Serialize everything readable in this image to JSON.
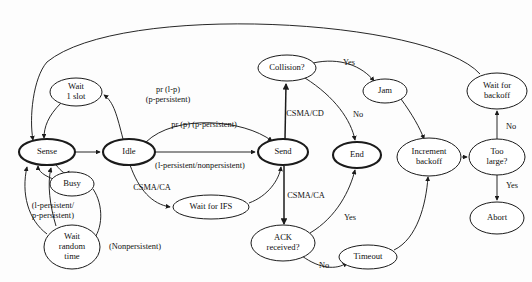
{
  "diagram": {
    "background_color": "#fdfdfd",
    "stroke_color": "#1b1b1b",
    "nodes": [
      {
        "id": "sense",
        "label_lines": [
          "Sense"
        ],
        "cx": 47,
        "cy": 152,
        "rx": 28,
        "ry": 13,
        "bold": true
      },
      {
        "id": "wait1slot",
        "label_lines": [
          "Wait",
          "1 slot"
        ],
        "cx": 76,
        "cy": 92,
        "rx": 26,
        "ry": 14,
        "bold": false
      },
      {
        "id": "idle",
        "label_lines": [
          "Idle"
        ],
        "cx": 129,
        "cy": 152,
        "rx": 26,
        "ry": 13,
        "bold": true
      },
      {
        "id": "busy",
        "label_lines": [
          "Busy"
        ],
        "cx": 72,
        "cy": 184,
        "rx": 22,
        "ry": 12,
        "bold": false
      },
      {
        "id": "waitrandom",
        "label_lines": [
          "Wait",
          "random",
          "time"
        ],
        "cx": 72,
        "cy": 247,
        "rx": 28,
        "ry": 22,
        "bold": false
      },
      {
        "id": "waitifs",
        "label_lines": [
          "Wait for IFS"
        ],
        "cx": 211,
        "cy": 207,
        "rx": 38,
        "ry": 12,
        "bold": false
      },
      {
        "id": "send",
        "label_lines": [
          "Send"
        ],
        "cx": 283,
        "cy": 152,
        "rx": 25,
        "ry": 13,
        "bold": true
      },
      {
        "id": "collision",
        "label_lines": [
          "Collision?"
        ],
        "cx": 287,
        "cy": 68,
        "rx": 29,
        "ry": 13,
        "bold": false
      },
      {
        "id": "jam",
        "label_lines": [
          "Jam"
        ],
        "cx": 385,
        "cy": 91,
        "rx": 22,
        "ry": 12,
        "bold": false
      },
      {
        "id": "end",
        "label_lines": [
          "End"
        ],
        "cx": 357,
        "cy": 155,
        "rx": 24,
        "ry": 13,
        "bold": true
      },
      {
        "id": "ack",
        "label_lines": [
          "ACK",
          "received?"
        ],
        "cx": 283,
        "cy": 243,
        "rx": 32,
        "ry": 18,
        "bold": false
      },
      {
        "id": "timeout",
        "label_lines": [
          "Timeout"
        ],
        "cx": 368,
        "cy": 257,
        "rx": 29,
        "ry": 12,
        "bold": false
      },
      {
        "id": "increment",
        "label_lines": [
          "Increment",
          "backoff"
        ],
        "cx": 429,
        "cy": 157,
        "rx": 32,
        "ry": 19,
        "bold": false
      },
      {
        "id": "toolarge",
        "label_lines": [
          "Too",
          "large?"
        ],
        "cx": 497,
        "cy": 157,
        "rx": 28,
        "ry": 18,
        "bold": false
      },
      {
        "id": "waitbackoff",
        "label_lines": [
          "Wait for",
          "backoff"
        ],
        "cx": 497,
        "cy": 91,
        "rx": 30,
        "ry": 18,
        "bold": false
      },
      {
        "id": "abort",
        "label_lines": [
          "Abort"
        ],
        "cx": 497,
        "cy": 218,
        "rx": 27,
        "ry": 16,
        "bold": false
      }
    ],
    "edges": [
      {
        "id": "waitbackoff-to-sense",
        "from": "waitbackoff",
        "to": "sense",
        "path": "M 480 74 C 430 18 120 2 47 62 C 33 78 29 118 33 140",
        "thick": false
      },
      {
        "id": "wait1slot-to-sense",
        "from": "wait1slot",
        "to": "sense",
        "path": "M 61 103 C 48 116 44 127 44 138",
        "thick": false
      },
      {
        "id": "idle-to-wait1slot",
        "from": "idle",
        "to": "wait1slot",
        "path": "M 123 139 C 117 116 114 102 104 95",
        "thick": false
      },
      {
        "id": "sense-to-idle",
        "from": "sense",
        "to": "idle",
        "path": "M 75 152 L 100 152",
        "thick": false
      },
      {
        "id": "idle-to-send-top",
        "from": "idle",
        "to": "send",
        "path": "M 146 142 C 175 114 243 119 272 141",
        "thick": false
      },
      {
        "id": "idle-to-send-mid",
        "from": "idle",
        "to": "send",
        "path": "M 155 152 L 255 152",
        "thick": false
      },
      {
        "id": "idle-to-waitifs",
        "from": "idle",
        "to": "waitifs",
        "path": "M 130 165 C 139 190 152 204 170 207",
        "thick": false
      },
      {
        "id": "waitifs-to-send",
        "from": "waitifs",
        "to": "send",
        "path": "M 249 203 C 268 196 279 180 281 167",
        "thick": false
      },
      {
        "id": "sense-to-busy",
        "from": "sense",
        "to": "busy",
        "path": "M 56 165 C 62 172 66 176 69 171",
        "thick": false
      },
      {
        "id": "busy-to-sense",
        "from": "busy",
        "to": "sense",
        "path": "M 56 180 C 44 176 38 171 38 166",
        "thick": false
      },
      {
        "id": "busy-to-waitrandom",
        "from": "busy",
        "to": "waitrandom",
        "path": "M 93 189 C 104 205 103 230 92 241",
        "thick": false
      },
      {
        "id": "waitrandom-to-sense",
        "from": "waitrandom",
        "to": "sense",
        "path": "M 47 234 C 28 220 21 193 27 167",
        "thick": false
      },
      {
        "id": "persist-loop-to-sense",
        "from": "waitrandom",
        "to": "sense",
        "path": "M 56 226 C 50 206 47 184 51 168",
        "thick": false
      },
      {
        "id": "send-to-collision",
        "from": "send",
        "to": "collision",
        "path": "M 285 139 L 286 84",
        "thick": true
      },
      {
        "id": "collision-to-jam",
        "from": "collision",
        "to": "jam",
        "path": "M 313 63 C 340 57 362 66 374 81",
        "thick": false
      },
      {
        "id": "collision-to-end",
        "from": "collision",
        "to": "end",
        "path": "M 305 78 C 335 97 351 120 355 140",
        "thick": false
      },
      {
        "id": "jam-to-increment",
        "from": "jam",
        "to": "increment",
        "path": "M 401 99 C 412 114 420 128 424 139",
        "thick": false
      },
      {
        "id": "send-to-ack",
        "from": "send",
        "to": "ack",
        "path": "M 284 166 L 284 224",
        "thick": true
      },
      {
        "id": "ack-to-end",
        "from": "ack",
        "to": "end",
        "path": "M 310 233 C 337 217 350 190 355 170",
        "thick": false
      },
      {
        "id": "ack-to-timeout",
        "from": "ack",
        "to": "timeout",
        "path": "M 302 256 C 320 269 336 270 347 263",
        "thick": false
      },
      {
        "id": "timeout-to-increment",
        "from": "timeout",
        "to": "increment",
        "path": "M 394 250 C 417 239 426 205 428 177",
        "thick": false
      },
      {
        "id": "increment-to-toolarge",
        "from": "increment",
        "to": "toolarge",
        "path": "M 462 157 L 467 157",
        "thick": false
      },
      {
        "id": "toolarge-to-waitbackoff",
        "from": "toolarge",
        "to": "waitbackoff",
        "path": "M 497 139 L 497 111",
        "thick": false
      },
      {
        "id": "toolarge-to-abort",
        "from": "toolarge",
        "to": "abort",
        "path": "M 497 175 L 497 200",
        "thick": false
      }
    ],
    "edge_labels": [
      {
        "id": "lbl-pr-1p",
        "lines": [
          "pr (l-p)",
          "(p-persistent)"
        ],
        "x": 168,
        "y": 95
      },
      {
        "id": "lbl-pr-p",
        "lines": [
          "pr (p) (p-persistent)"
        ],
        "x": 204,
        "y": 125
      },
      {
        "id": "lbl-persistent",
        "lines": [
          "(l-persistent/nonpersistent)"
        ],
        "x": 200,
        "y": 166
      },
      {
        "id": "lbl-csma-ca-1",
        "lines": [
          "CSMA/CA"
        ],
        "x": 152,
        "y": 188
      },
      {
        "id": "lbl-csma-cd",
        "lines": [
          "CSMA/CD"
        ],
        "x": 305,
        "y": 114
      },
      {
        "id": "lbl-csma-ca-2",
        "lines": [
          "CSMA/CA"
        ],
        "x": 306,
        "y": 196
      },
      {
        "id": "lbl-yes-jam",
        "lines": [
          "Yes"
        ],
        "x": 349,
        "y": 63
      },
      {
        "id": "lbl-no-end",
        "lines": [
          "No"
        ],
        "x": 358,
        "y": 115
      },
      {
        "id": "lbl-yes-ack",
        "lines": [
          "Yes"
        ],
        "x": 350,
        "y": 218
      },
      {
        "id": "lbl-no-timeout",
        "lines": [
          "No"
        ],
        "x": 324,
        "y": 266
      },
      {
        "id": "lbl-no-backoff",
        "lines": [
          "No"
        ],
        "x": 511,
        "y": 127
      },
      {
        "id": "lbl-yes-abort",
        "lines": [
          "Yes"
        ],
        "x": 512,
        "y": 186
      },
      {
        "id": "lbl-persist2",
        "lines": [
          "(l-persistent/",
          "p-persistent)"
        ],
        "x": 53,
        "y": 211
      },
      {
        "id": "lbl-nonpersist",
        "lines": [
          "(Nonpersistent)"
        ],
        "x": 135,
        "y": 247
      }
    ]
  }
}
